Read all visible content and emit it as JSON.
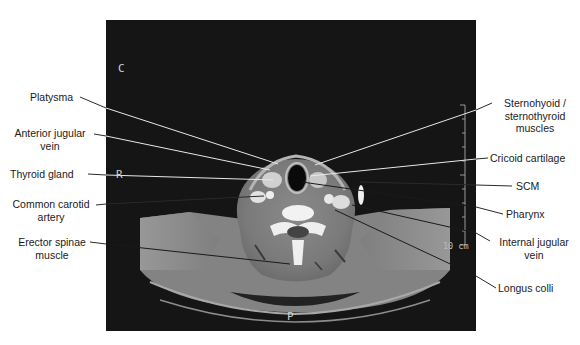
{
  "figure": {
    "type": "axial CT scan of the neck at cricoid cartilage level",
    "orientation_markers": {
      "top": "C",
      "side": "R",
      "bottom": "P"
    },
    "scale_bar": "10 cm"
  },
  "labels_left": [
    {
      "text": "Platysma",
      "line2": ""
    },
    {
      "text": "Anterior jugular",
      "line2": "vein"
    },
    {
      "text": "Thyroid gland",
      "line2": ""
    },
    {
      "text": "Common carotid",
      "line2": "artery"
    },
    {
      "text": "Erector spinae",
      "line2": "muscle"
    }
  ],
  "labels_right": [
    {
      "text": "Sternohyoid /",
      "line2": "sternothyroid",
      "line3": "muscles"
    },
    {
      "text": "Cricoid cartilage",
      "line2": "",
      "line3": ""
    },
    {
      "text": "SCM",
      "line2": "",
      "line3": ""
    },
    {
      "text": "Pharynx",
      "line2": "",
      "line3": ""
    },
    {
      "text": "Internal jugular",
      "line2": "vein",
      "line3": ""
    },
    {
      "text": "Longus colli",
      "line2": "",
      "line3": ""
    }
  ],
  "colors": {
    "background": "#ffffff",
    "scan_background": "#151515",
    "label_text": "#1a1a1a",
    "leader_line_outside": "#2a2a2a",
    "leader_line_inside": "#e8e8e8"
  }
}
